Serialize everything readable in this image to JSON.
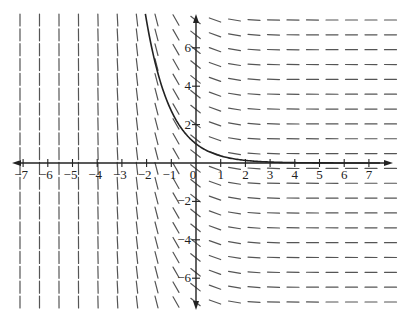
{
  "chart_data": {
    "type": "slope_field",
    "title": "",
    "differential_equation": "dy/dx = -e^(-x)",
    "solution_curve": "y = e^(-x)",
    "x_ticks": [
      -7,
      -6,
      -5,
      -4,
      -3,
      -2,
      -1,
      0,
      1,
      2,
      3,
      4,
      5,
      6,
      7
    ],
    "y_ticks": [
      -6,
      -4,
      -2,
      2,
      4,
      6
    ],
    "xlim": [
      -7.5,
      7.7
    ],
    "ylim": [
      -7.7,
      7.7
    ],
    "origin_label": "0",
    "grid": {
      "columns_px": [
        20,
        39.5,
        59,
        78.5,
        98,
        117.5,
        137,
        156.5,
        176,
        195.5,
        215,
        234.5,
        254,
        273.5,
        293,
        312.5,
        332,
        351.5,
        371,
        390.5
      ],
      "row_start_px": 20,
      "row_end_px": 302,
      "row_count": 20
    },
    "curve_x_range": [
      -2.05,
      8.0
    ]
  },
  "layout": {
    "origin_px": [
      196,
      163
    ],
    "unit_x_px": 24.7,
    "unit_y_px": 19.2,
    "x_axis_px": [
      12,
      393
    ],
    "y_axis_px": [
      14,
      310
    ],
    "segment_half_len_px": 6
  },
  "labels": {
    "x": [
      "−7",
      "−6",
      "−5",
      "−4",
      "−3",
      "−2",
      "−1",
      "0",
      "1",
      "2",
      "3",
      "4",
      "5",
      "6",
      "7"
    ],
    "y": [
      "−6",
      "−4",
      "−2",
      "2",
      "4",
      "6"
    ]
  }
}
